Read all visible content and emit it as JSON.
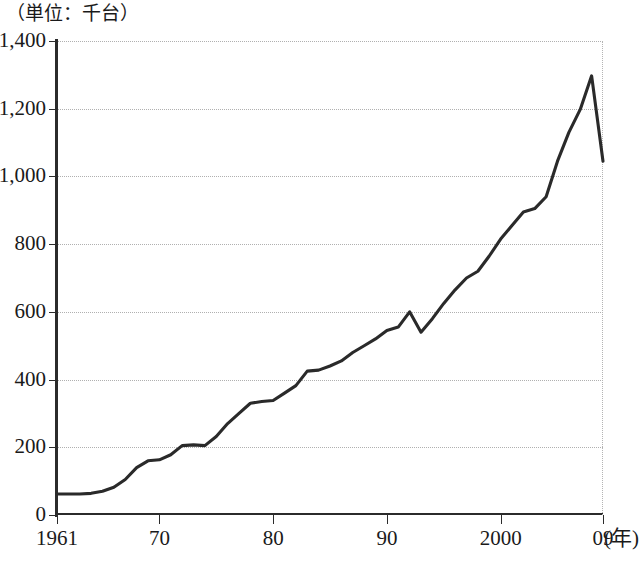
{
  "chart_data": {
    "type": "line",
    "title": "",
    "unit_caption": "（単位：千台）",
    "xlabel": "(年)",
    "ylabel": "",
    "xlim": [
      1961,
      2009
    ],
    "ylim": [
      0,
      1400
    ],
    "grid": true,
    "legend": false,
    "y_ticks": [
      "0",
      "200",
      "400",
      "600",
      "800",
      "1,000",
      "1,200",
      "1,400"
    ],
    "y_tick_values": [
      0,
      200,
      400,
      600,
      800,
      1000,
      1200,
      1400
    ],
    "x_ticks": [
      "1961",
      "70",
      "80",
      "90",
      "2000",
      "09"
    ],
    "x_tick_values": [
      1961,
      1970,
      1980,
      1990,
      2000,
      2009
    ],
    "line_color": "#2a2a2a",
    "grid_color": "#b0b0b0",
    "axis_color": "#2b2b2b",
    "series": [
      {
        "name": "",
        "x": [
          1961,
          1962,
          1963,
          1964,
          1965,
          1966,
          1967,
          1968,
          1969,
          1970,
          1971,
          1972,
          1973,
          1974,
          1975,
          1976,
          1977,
          1978,
          1979,
          1980,
          1981,
          1982,
          1983,
          1984,
          1985,
          1986,
          1987,
          1988,
          1989,
          1990,
          1991,
          1992,
          1993,
          1994,
          1995,
          1996,
          1997,
          1998,
          1999,
          2000,
          2001,
          2002,
          2003,
          2004,
          2005,
          2006,
          2007,
          2008,
          2009
        ],
        "values": [
          62,
          62,
          62,
          64,
          70,
          82,
          105,
          140,
          160,
          163,
          178,
          205,
          207,
          205,
          232,
          270,
          300,
          330,
          335,
          338,
          360,
          382,
          425,
          428,
          440,
          455,
          480,
          500,
          520,
          545,
          555,
          600,
          540,
          580,
          625,
          665,
          700,
          720,
          765,
          815,
          855,
          895,
          905,
          940,
          1045,
          1130,
          1198,
          1297,
          1045
        ]
      }
    ]
  }
}
